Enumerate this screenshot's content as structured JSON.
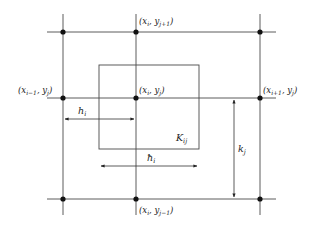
{
  "diagram": {
    "nodes": [
      {
        "id": "top-left",
        "label": ""
      },
      {
        "id": "top-center",
        "label": "(xi, yj+1)",
        "tex": "(x_i, y_{j+1})"
      },
      {
        "id": "top-right",
        "label": ""
      },
      {
        "id": "mid-left",
        "label": "(xi−1, yj)",
        "tex": "(x_{i-1}, y_j)"
      },
      {
        "id": "mid-center",
        "label": "(xi, yj)",
        "tex": "(x_i, y_j)"
      },
      {
        "id": "mid-right",
        "label": "(xi+1, yj)",
        "tex": "(x_{i+1}, y_j)"
      },
      {
        "id": "bottom-left",
        "label": ""
      },
      {
        "id": "bottom-center",
        "label": "(xi, yj−1)",
        "tex": "(x_i, y_{j-1})"
      },
      {
        "id": "bottom-right",
        "label": ""
      }
    ],
    "cell_label": {
      "main": "K",
      "sub": "ij"
    },
    "dimensions": {
      "h": {
        "main": "h",
        "sub": "i"
      },
      "hbar": {
        "main": "ħ",
        "sub": "i"
      },
      "k": {
        "main": "k",
        "sub": "j"
      }
    },
    "labels": {
      "top_center": {
        "open": "(",
        "x": "x",
        "xsub": "i",
        "sep": ", ",
        "y": "y",
        "ysub": "j+1",
        "close": ")"
      },
      "mid_left": {
        "open": "(",
        "x": "x",
        "xsub": "i−1",
        "sep": ", ",
        "y": "y",
        "ysub": "j",
        "close": ")"
      },
      "mid_center": {
        "open": "(",
        "x": "x",
        "xsub": "i",
        "sep": ", ",
        "y": "y",
        "ysub": "j",
        "close": ")"
      },
      "mid_right": {
        "open": "(",
        "x": "x",
        "xsub": "i+1",
        "sep": ", ",
        "y": "y",
        "ysub": "j",
        "close": ")"
      },
      "bottom_center": {
        "open": "(",
        "x": "x",
        "xsub": "i",
        "sep": ", ",
        "y": "y",
        "ysub": "j−1",
        "close": ")"
      }
    }
  }
}
